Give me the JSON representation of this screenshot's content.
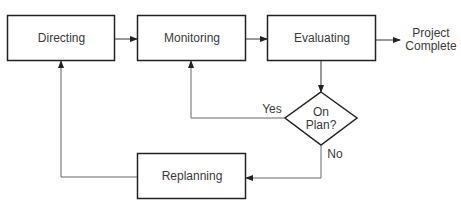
{
  "diagram": {
    "type": "flowchart",
    "nodes": {
      "directing": {
        "label": "Directing",
        "shape": "rectangle"
      },
      "monitoring": {
        "label": "Monitoring",
        "shape": "rectangle"
      },
      "evaluating": {
        "label": "Evaluating",
        "shape": "rectangle"
      },
      "decision": {
        "label_line1": "On",
        "label_line2": "Plan?",
        "shape": "diamond"
      },
      "replanning": {
        "label": "Replanning",
        "shape": "rectangle"
      },
      "terminal": {
        "label_line1": "Project",
        "label_line2": "Complete",
        "shape": "text"
      }
    },
    "edges": [
      {
        "from": "Directing",
        "to": "Monitoring",
        "label": ""
      },
      {
        "from": "Monitoring",
        "to": "Evaluating",
        "label": ""
      },
      {
        "from": "Evaluating",
        "to": "Project Complete",
        "label": ""
      },
      {
        "from": "Evaluating",
        "to": "On Plan?",
        "label": ""
      },
      {
        "from": "On Plan?",
        "to": "Monitoring",
        "label": "Yes"
      },
      {
        "from": "On Plan?",
        "to": "Replanning",
        "label": "No"
      },
      {
        "from": "Replanning",
        "to": "Directing",
        "label": ""
      }
    ],
    "edge_labels": {
      "yes": "Yes",
      "no": "No"
    },
    "colors": {
      "stroke": "#222222",
      "line": "#555555",
      "text": "#3a3a3a"
    }
  }
}
